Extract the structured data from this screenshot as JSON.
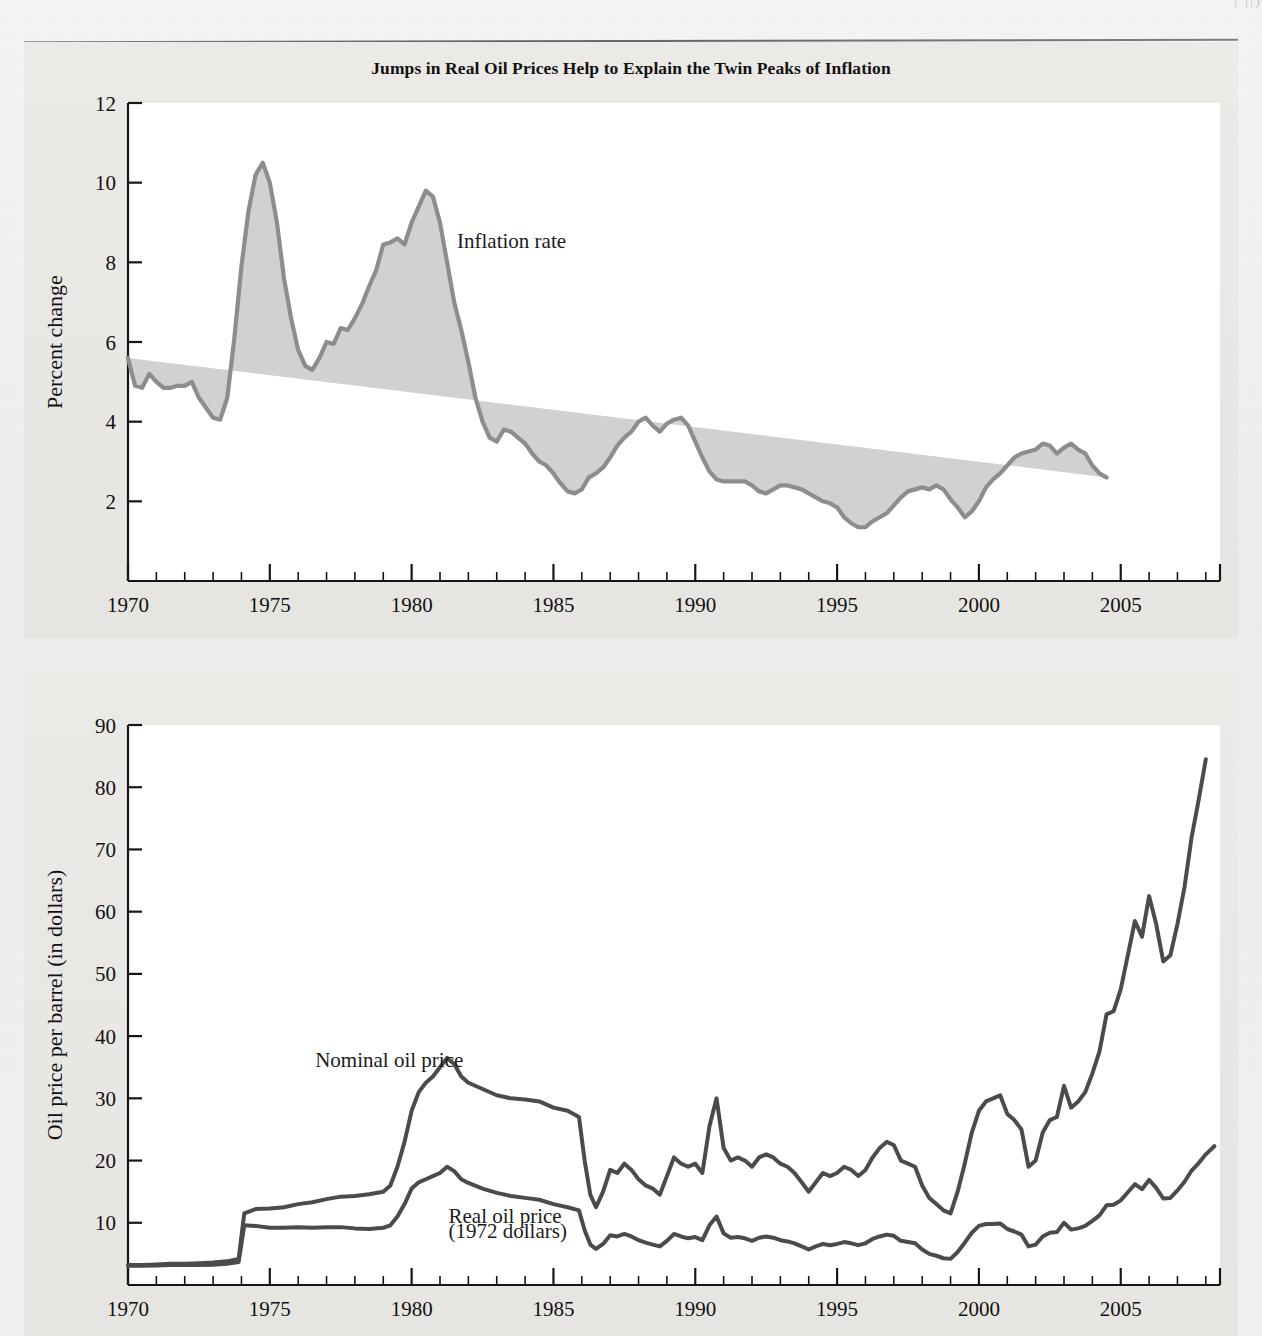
{
  "figure": {
    "title": "Jumps in Real Oil Prices Help to Explain the Twin Peaks of Inflation",
    "page_remnant": "|                  ||)"
  },
  "colors": {
    "inflation_fill": "#d2d1cf",
    "inflation_line": "#8e8d8b",
    "oil_line": "#4c4b49",
    "axis": "#161616",
    "band": "#eceae7",
    "plot": "#ffffff"
  },
  "chart_data": [
    {
      "type": "area",
      "id": "inflation",
      "title": "Jumps in Real Oil Prices Help to Explain the Twin Peaks of Inflation",
      "xlabel": "",
      "ylabel": "Percent change",
      "xlim": [
        1970,
        2008.5
      ],
      "ylim": [
        0,
        12
      ],
      "yticks": [
        2,
        4,
        6,
        8,
        10,
        12
      ],
      "xticks": [
        1970,
        1975,
        1980,
        1985,
        1990,
        1995,
        2000,
        2005
      ],
      "xtick_minor_step": 1,
      "grid": false,
      "legend": "inline-annotation",
      "annotations": [
        {
          "text": "Inflation rate",
          "x": 1981.6,
          "y": 8.35
        }
      ],
      "series": [
        {
          "name": "Inflation rate",
          "x": [
            1970.0,
            1970.25,
            1970.5,
            1970.75,
            1971.0,
            1971.25,
            1971.5,
            1971.75,
            1972.0,
            1972.25,
            1972.5,
            1972.75,
            1973.0,
            1973.25,
            1973.5,
            1973.75,
            1974.0,
            1974.25,
            1974.5,
            1974.75,
            1975.0,
            1975.25,
            1975.5,
            1975.75,
            1976.0,
            1976.25,
            1976.5,
            1976.75,
            1977.0,
            1977.25,
            1977.5,
            1977.75,
            1978.0,
            1978.25,
            1978.5,
            1978.75,
            1979.0,
            1979.25,
            1979.5,
            1979.75,
            1980.0,
            1980.25,
            1980.5,
            1980.75,
            1981.0,
            1981.25,
            1981.5,
            1981.75,
            1982.0,
            1982.25,
            1982.5,
            1982.75,
            1983.0,
            1983.25,
            1983.5,
            1983.75,
            1984.0,
            1984.25,
            1984.5,
            1984.75,
            1985.0,
            1985.25,
            1985.5,
            1985.75,
            1986.0,
            1986.25,
            1986.5,
            1986.75,
            1987.0,
            1987.25,
            1987.5,
            1987.75,
            1988.0,
            1988.25,
            1988.5,
            1988.75,
            1989.0,
            1989.25,
            1989.5,
            1989.75,
            1990.0,
            1990.25,
            1990.5,
            1990.75,
            1991.0,
            1991.25,
            1991.5,
            1991.75,
            1992.0,
            1992.25,
            1992.5,
            1992.75,
            1993.0,
            1993.25,
            1993.5,
            1993.75,
            1994.0,
            1994.25,
            1994.5,
            1994.75,
            1995.0,
            1995.25,
            1995.5,
            1995.75,
            1996.0,
            1996.25,
            1996.5,
            1996.75,
            1997.0,
            1997.25,
            1997.5,
            1997.75,
            1998.0,
            1998.25,
            1998.5,
            1998.75,
            1999.0,
            1999.25,
            1999.5,
            1999.75,
            2000.0,
            2000.25,
            2000.5,
            2000.75,
            2001.0,
            2001.25,
            2001.5,
            2001.75,
            2002.0,
            2002.25,
            2002.5,
            2002.75,
            2003.0,
            2003.25,
            2003.5,
            2003.75,
            2004.0,
            2004.25,
            2004.5,
            2004.75,
            2005.0,
            2005.25,
            2005.5,
            2005.75,
            2006.0,
            2006.25,
            2006.5,
            2006.75,
            2007.0,
            2007.25,
            2007.5,
            2007.75,
            2008.0,
            2008.25
          ],
          "y": [
            5.6,
            4.9,
            4.85,
            5.2,
            5.0,
            4.85,
            4.85,
            4.9,
            4.9,
            5.0,
            4.6,
            4.35,
            4.1,
            4.05,
            4.6,
            6.1,
            7.9,
            9.3,
            10.2,
            10.5,
            10.0,
            9.0,
            7.6,
            6.6,
            5.8,
            5.4,
            5.3,
            5.6,
            6.0,
            5.95,
            6.35,
            6.3,
            6.6,
            6.95,
            7.4,
            7.8,
            8.45,
            8.5,
            8.6,
            8.45,
            9.0,
            9.4,
            9.8,
            9.65,
            9.0,
            8.0,
            7.0,
            6.3,
            5.5,
            4.6,
            4.0,
            3.6,
            3.5,
            3.8,
            3.75,
            3.6,
            3.45,
            3.2,
            3.0,
            2.9,
            2.7,
            2.45,
            2.25,
            2.2,
            2.3,
            2.6,
            2.7,
            2.85,
            3.1,
            3.4,
            3.6,
            3.75,
            4.0,
            4.1,
            3.9,
            3.75,
            3.95,
            4.05,
            4.1,
            3.9,
            3.5,
            3.1,
            2.75,
            2.55,
            2.5,
            2.5,
            2.5,
            2.5,
            2.4,
            2.25,
            2.2,
            2.3,
            2.4,
            2.4,
            2.35,
            2.3,
            2.2,
            2.1,
            2.0,
            1.95,
            1.85,
            1.6,
            1.45,
            1.35,
            1.35,
            1.5,
            1.6,
            1.7,
            1.9,
            2.1,
            2.25,
            2.3,
            2.35,
            2.3,
            2.4,
            2.3,
            2.05,
            1.85,
            1.6,
            1.75,
            2.0,
            2.35,
            2.55,
            2.7,
            2.9,
            3.1,
            3.2,
            3.25,
            3.3,
            3.45,
            3.4,
            3.2,
            3.35,
            3.45,
            3.3,
            3.2,
            2.9,
            2.7,
            2.6
          ]
        }
      ]
    },
    {
      "type": "line",
      "id": "oil-prices",
      "title": "",
      "xlabel": "",
      "ylabel": "Oil price per barrel (in dollars)",
      "xlim": [
        1970,
        2008.5
      ],
      "ylim": [
        0,
        90
      ],
      "yticks": [
        10,
        20,
        30,
        40,
        50,
        60,
        70,
        80,
        90
      ],
      "xticks": [
        1970,
        1975,
        1980,
        1985,
        1990,
        1995,
        2000,
        2005
      ],
      "xtick_minor_step": 1,
      "grid": false,
      "legend": "inline-annotation",
      "annotations": [
        {
          "text": "Nominal oil price",
          "x": 1976.6,
          "y": 35.0
        },
        {
          "text": "Real oil price",
          "x": 1981.3,
          "y": 10.0
        },
        {
          "text": "(1972 dollars)",
          "x": 1981.3,
          "y": 7.6
        }
      ],
      "series": [
        {
          "name": "Nominal oil price",
          "x": [
            1970,
            1970.5,
            1971,
            1971.5,
            1972,
            1972.5,
            1973,
            1973.5,
            1973.9,
            1974.1,
            1974.5,
            1975,
            1975.5,
            1976,
            1976.5,
            1977,
            1977.5,
            1978,
            1978.5,
            1979,
            1979.25,
            1979.5,
            1979.75,
            1980,
            1980.25,
            1980.5,
            1980.75,
            1981,
            1981.25,
            1981.5,
            1981.75,
            1982,
            1982.5,
            1983,
            1983.5,
            1984,
            1984.5,
            1985,
            1985.5,
            1985.9,
            1986.1,
            1986.3,
            1986.5,
            1986.75,
            1987,
            1987.25,
            1987.5,
            1987.75,
            1988,
            1988.25,
            1988.5,
            1988.75,
            1989,
            1989.25,
            1989.5,
            1989.75,
            1990,
            1990.25,
            1990.5,
            1990.75,
            1991,
            1991.25,
            1991.5,
            1991.75,
            1992,
            1992.25,
            1992.5,
            1992.75,
            1993,
            1993.25,
            1993.5,
            1993.75,
            1994,
            1994.25,
            1994.5,
            1994.75,
            1995,
            1995.25,
            1995.5,
            1995.75,
            1996,
            1996.25,
            1996.5,
            1996.75,
            1997,
            1997.25,
            1997.5,
            1997.75,
            1998,
            1998.25,
            1998.5,
            1998.75,
            1999,
            1999.25,
            1999.5,
            1999.75,
            2000,
            2000.25,
            2000.5,
            2000.75,
            2001,
            2001.25,
            2001.5,
            2001.75,
            2002,
            2002.25,
            2002.5,
            2002.75,
            2003,
            2003.25,
            2003.5,
            2003.75,
            2004,
            2004.25,
            2004.5,
            2004.75,
            2005,
            2005.25,
            2005.5,
            2005.75,
            2006,
            2006.25,
            2006.5,
            2006.75,
            2007,
            2007.25,
            2007.5,
            2007.75,
            2008,
            2008.3
          ],
          "y": [
            3.2,
            3.2,
            3.3,
            3.4,
            3.4,
            3.5,
            3.6,
            3.8,
            4.2,
            11.5,
            12.2,
            12.3,
            12.5,
            13.0,
            13.3,
            13.8,
            14.2,
            14.3,
            14.6,
            15.0,
            16.0,
            19.0,
            23.0,
            28.0,
            31.0,
            32.5,
            33.5,
            35.0,
            36.5,
            35.5,
            33.5,
            32.5,
            31.5,
            30.5,
            30.0,
            29.8,
            29.5,
            28.5,
            28.0,
            27.0,
            20.0,
            14.5,
            12.5,
            15.0,
            18.5,
            18.0,
            19.5,
            18.5,
            17.0,
            16.0,
            15.5,
            14.5,
            17.5,
            20.5,
            19.5,
            19.0,
            19.5,
            18.0,
            25.5,
            30.0,
            22.0,
            20.0,
            20.5,
            20.0,
            19.0,
            20.5,
            21.0,
            20.5,
            19.5,
            19.0,
            18.0,
            16.5,
            15.0,
            16.5,
            18.0,
            17.5,
            18.0,
            19.0,
            18.5,
            17.5,
            18.5,
            20.5,
            22.0,
            23.0,
            22.5,
            20.0,
            19.5,
            19.0,
            16.0,
            14.0,
            13.0,
            12.0,
            11.5,
            15.0,
            19.5,
            24.5,
            28.0,
            29.5,
            30.0,
            30.5,
            27.5,
            26.5,
            25.0,
            19.0,
            20.0,
            24.5,
            26.5,
            27.0,
            32.0,
            28.5,
            29.5,
            31.0,
            34.0,
            37.5,
            43.5,
            44.0,
            47.5,
            53.0,
            58.5,
            56.0,
            62.5,
            58.0,
            52.0,
            53.0,
            58.0,
            64.0,
            72.0,
            78.0,
            84.5
          ]
        },
        {
          "name": "Real oil price (1972 dollars)",
          "x": [
            1970,
            1970.5,
            1971,
            1971.5,
            1972,
            1972.5,
            1973,
            1973.5,
            1973.9,
            1974.1,
            1974.5,
            1975,
            1975.5,
            1976,
            1976.5,
            1977,
            1977.5,
            1978,
            1978.5,
            1979,
            1979.25,
            1979.5,
            1979.75,
            1980,
            1980.25,
            1980.5,
            1980.75,
            1981,
            1981.25,
            1981.5,
            1981.75,
            1982,
            1982.5,
            1983,
            1983.5,
            1984,
            1984.5,
            1985,
            1985.5,
            1985.9,
            1986.1,
            1986.3,
            1986.5,
            1986.75,
            1987,
            1987.25,
            1987.5,
            1987.75,
            1988,
            1988.25,
            1988.5,
            1988.75,
            1989,
            1989.25,
            1989.5,
            1989.75,
            1990,
            1990.25,
            1990.5,
            1990.75,
            1991,
            1991.25,
            1991.5,
            1991.75,
            1992,
            1992.25,
            1992.5,
            1992.75,
            1993,
            1993.25,
            1993.5,
            1993.75,
            1994,
            1994.25,
            1994.5,
            1994.75,
            1995,
            1995.25,
            1995.5,
            1995.75,
            1996,
            1996.25,
            1996.5,
            1996.75,
            1997,
            1997.25,
            1997.5,
            1997.75,
            1998,
            1998.25,
            1998.5,
            1998.75,
            1999,
            1999.25,
            1999.5,
            1999.75,
            2000,
            2000.25,
            2000.5,
            2000.75,
            2001,
            2001.25,
            2001.5,
            2001.75,
            2002,
            2002.25,
            2002.5,
            2002.75,
            2003,
            2003.25,
            2003.5,
            2003.75,
            2004,
            2004.25,
            2004.5,
            2004.75,
            2005,
            2005.25,
            2005.5,
            2005.75,
            2006,
            2006.25,
            2006.5,
            2006.75,
            2007,
            2007.25,
            2007.5,
            2007.75,
            2008,
            2008.3
          ],
          "y": [
            3.1,
            3.1,
            3.15,
            3.2,
            3.2,
            3.2,
            3.25,
            3.4,
            3.7,
            9.6,
            9.5,
            9.2,
            9.2,
            9.3,
            9.2,
            9.3,
            9.3,
            9.1,
            9.0,
            9.2,
            9.6,
            11.0,
            13.0,
            15.5,
            16.5,
            17.0,
            17.5,
            18.0,
            19.0,
            18.3,
            17.0,
            16.4,
            15.5,
            14.8,
            14.3,
            14.0,
            13.7,
            13.0,
            12.5,
            12.0,
            8.8,
            6.5,
            5.8,
            6.6,
            8.0,
            7.8,
            8.2,
            7.8,
            7.2,
            6.8,
            6.5,
            6.2,
            7.1,
            8.2,
            7.8,
            7.5,
            7.7,
            7.2,
            9.6,
            11.0,
            8.3,
            7.6,
            7.7,
            7.5,
            7.1,
            7.6,
            7.8,
            7.6,
            7.2,
            7.0,
            6.7,
            6.2,
            5.7,
            6.2,
            6.6,
            6.4,
            6.6,
            6.9,
            6.7,
            6.4,
            6.7,
            7.4,
            7.8,
            8.1,
            7.9,
            7.1,
            6.9,
            6.7,
            5.7,
            5.0,
            4.7,
            4.3,
            4.2,
            5.3,
            6.8,
            8.4,
            9.5,
            9.8,
            9.8,
            9.9,
            9.0,
            8.6,
            8.1,
            6.2,
            6.5,
            7.8,
            8.4,
            8.5,
            10.0,
            8.9,
            9.1,
            9.5,
            10.3,
            11.2,
            12.8,
            12.9,
            13.6,
            14.9,
            16.2,
            15.4,
            16.9,
            15.6,
            13.9,
            14.0,
            15.2,
            16.6,
            18.4,
            19.6,
            21.0,
            22.3
          ]
        }
      ]
    }
  ]
}
